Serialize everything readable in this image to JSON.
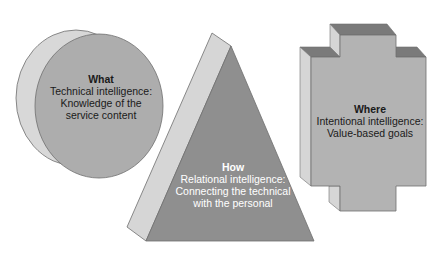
{
  "colors": {
    "background": "#ffffff",
    "side_face": "#d6d6d6",
    "top_face": "#7a7a7a",
    "front_circle": "#adadad",
    "front_triangle": "#8f8f8f",
    "front_cross": "#b3b3b3",
    "outline": "#6e6e6e"
  },
  "shapes": [
    {
      "id": "what",
      "shape": "cylinder",
      "title": "What",
      "lines": [
        "Technical intelligence:",
        "Knowledge of the",
        "service content"
      ]
    },
    {
      "id": "how",
      "shape": "pyramid",
      "title": "How",
      "lines": [
        "Relational intelligence:",
        "Connecting the technical",
        "with the personal"
      ]
    },
    {
      "id": "where",
      "shape": "cross",
      "title": "Where",
      "lines": [
        "Intentional intelligence:",
        "Value-based goals"
      ]
    }
  ]
}
